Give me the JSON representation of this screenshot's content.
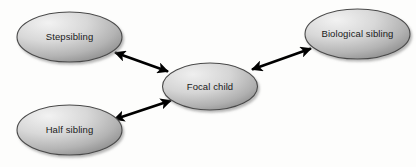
{
  "diagram": {
    "background_color": "#fdfdfc",
    "node_fill_light": "#ececec",
    "node_fill_dark": "#8f8f8f",
    "node_border_color": "#4a4a4a",
    "edge_color": "#000000",
    "label_color": "#1a1a1a",
    "nodes": [
      {
        "id": "stepsibling",
        "label": "Stepsibling",
        "cx": 69.5,
        "cy": 37,
        "rx": 52.5,
        "ry": 25
      },
      {
        "id": "biological-sibling",
        "label": "Biological sibling",
        "cx": 357.5,
        "cy": 34,
        "rx": 52.5,
        "ry": 25
      },
      {
        "id": "half-sibling",
        "label": "Half sibling",
        "cx": 69.5,
        "cy": 130,
        "rx": 52.5,
        "ry": 25
      },
      {
        "id": "focal-child",
        "label": "Focal child",
        "cx": 210,
        "cy": 86.5,
        "rx": 47.5,
        "ry": 23.5
      }
    ],
    "edges": [
      {
        "id": "edge-stepsibling-focal",
        "from": "stepsibling",
        "to": "focal-child",
        "direction": "bidirectional",
        "x1": 113,
        "y1": 53,
        "x2": 169,
        "y2": 72
      },
      {
        "id": "edge-biological-focal",
        "from": "biological-sibling",
        "to": "focal-child",
        "direction": "bidirectional",
        "x1": 313,
        "y1": 48,
        "x2": 251,
        "y2": 70
      },
      {
        "id": "edge-halfsibling-focal",
        "from": "half-sibling",
        "to": "focal-child",
        "direction": "bidirectional",
        "x1": 113,
        "y1": 120,
        "x2": 172,
        "y2": 100
      }
    ]
  }
}
